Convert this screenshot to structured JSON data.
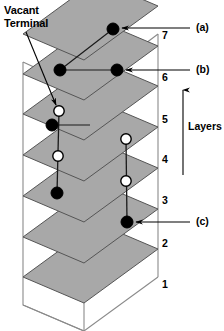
{
  "figure": {
    "title_label": "Vacant\nTerminal",
    "axis_label": "Layers",
    "background_color": "#ffffff",
    "plane_fill_color": "#a8a8a8",
    "plane_stroke_color": "#555555",
    "box_stroke_color": "#8a8a8a",
    "marker_filled_color": "#000000",
    "marker_open_fill_color": "#ffffff",
    "marker_open_stroke_color": "#000000",
    "layer_numbers": [
      "7",
      "6",
      "5",
      "4",
      "3",
      "2",
      "1"
    ],
    "callouts": [
      {
        "id": "a",
        "label": "(a)"
      },
      {
        "id": "b",
        "label": "(b)"
      },
      {
        "id": "c",
        "label": "(c)"
      }
    ],
    "markers": [
      {
        "type": "filled",
        "layer": 7,
        "x": 113,
        "y": 29
      },
      {
        "type": "filled",
        "layer": 6,
        "x": 60,
        "y": 70
      },
      {
        "type": "filled",
        "layer": 6,
        "x": 117,
        "y": 70
      },
      {
        "type": "open",
        "layer": 5,
        "x": 59,
        "y": 111
      },
      {
        "type": "filled",
        "layer": 5,
        "x": 52,
        "y": 125
      },
      {
        "type": "open",
        "layer": 4,
        "x": 126,
        "y": 139
      },
      {
        "type": "open",
        "layer": 4,
        "x": 58,
        "y": 156
      },
      {
        "type": "open",
        "layer": 3,
        "x": 126,
        "y": 181
      },
      {
        "type": "filled",
        "layer": 3,
        "x": 57,
        "y": 193
      },
      {
        "type": "filled",
        "layer": 2,
        "x": 127,
        "y": 222
      }
    ],
    "connectors": [
      {
        "from": [
          59,
          111
        ],
        "to": [
          57,
          193
        ]
      },
      {
        "from": [
          126,
          139
        ],
        "to": [
          127,
          222
        ]
      }
    ]
  }
}
